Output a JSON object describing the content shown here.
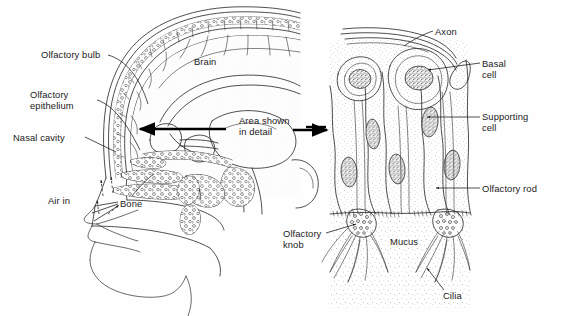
{
  "figure": {
    "type": "biological-diagram",
    "background_color": "#fefefe",
    "ink_color": "#222222",
    "text_color": "#1b1b1b"
  },
  "left_panel": {
    "name": "sagittal-head-section",
    "labels": [
      {
        "id": "olfactory-bulb",
        "text": "Olfactory bulb",
        "lines": [
          "Olfactory bulb"
        ]
      },
      {
        "id": "olfactory-epithelium",
        "text": "Olfactory epithelium",
        "lines": [
          "Olfactory",
          "epithelium"
        ]
      },
      {
        "id": "nasal-cavity",
        "text": "Nasal cavity",
        "lines": [
          "Nasal cavity"
        ]
      },
      {
        "id": "air-in",
        "text": "Air in",
        "lines": [
          "Air in"
        ]
      },
      {
        "id": "bone",
        "text": "Bone",
        "lines": [
          "Bone"
        ]
      },
      {
        "id": "brain",
        "text": "Brain",
        "lines": [
          "Brain"
        ]
      }
    ]
  },
  "connector": {
    "name": "area-shown-in-detail-callout",
    "lines": [
      "Area shown",
      "in detail"
    ],
    "text": "Area shown in detail"
  },
  "right_panel": {
    "name": "olfactory-epithelium-detail",
    "labels": [
      {
        "id": "axon",
        "text": "Axon",
        "lines": [
          "Axon"
        ]
      },
      {
        "id": "basal-cell",
        "text": "Basal cell",
        "lines": [
          "Basal",
          "cell"
        ]
      },
      {
        "id": "supporting-cell",
        "text": "Supporting cell",
        "lines": [
          "Supporting",
          "cell"
        ]
      },
      {
        "id": "olfactory-rod",
        "text": "Olfactory rod",
        "lines": [
          "Olfactory rod"
        ]
      },
      {
        "id": "olfactory-knob",
        "text": "Olfactory knob",
        "lines": [
          "Olfactory",
          "knob"
        ]
      },
      {
        "id": "mucus",
        "text": "Mucus",
        "lines": [
          "Mucus"
        ]
      },
      {
        "id": "cilia",
        "text": "Cilia",
        "lines": [
          "Cilia"
        ]
      }
    ]
  }
}
